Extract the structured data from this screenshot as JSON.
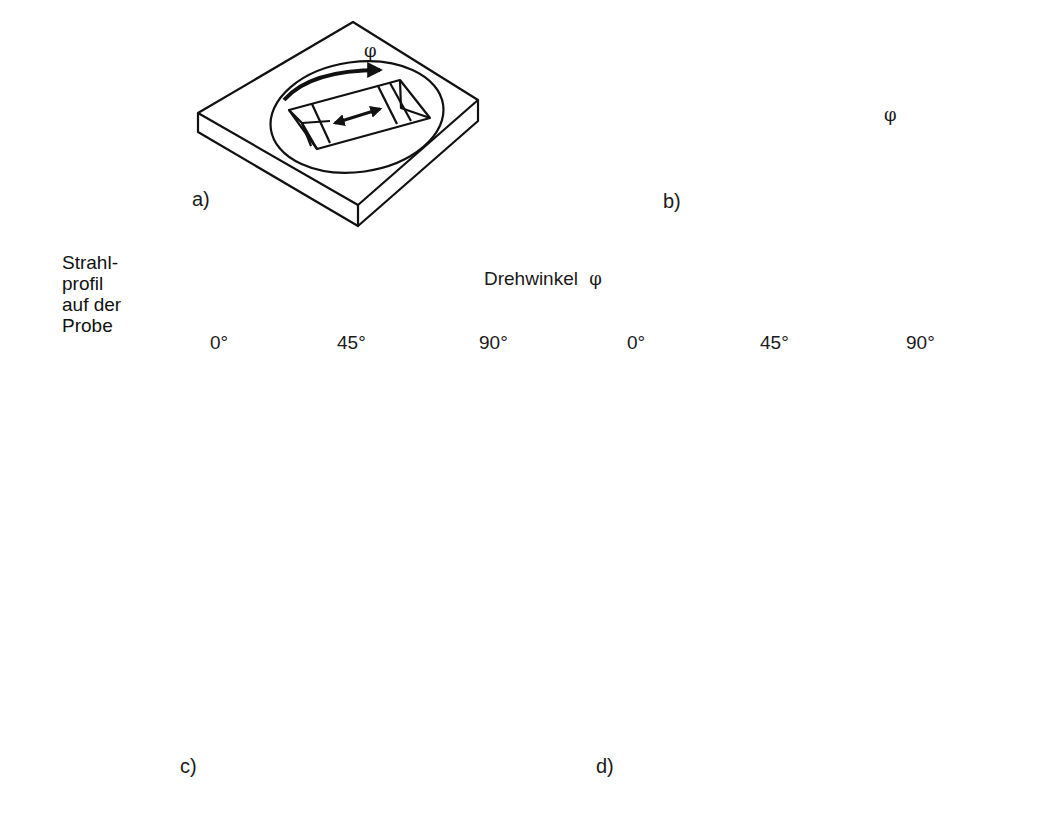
{
  "figure_a": {
    "label": "a)",
    "phi": "φ"
  },
  "figure_b": {
    "label": "b)",
    "phi": "φ"
  },
  "table": {
    "row_header": [
      "Strahl-",
      "profil",
      "auf der",
      "Probe"
    ],
    "column_group_title": "Drehwinkel",
    "column_group_symbol": "φ",
    "angles_c": [
      "0°",
      "45°",
      "90°"
    ],
    "angles_d": [
      "0°",
      "45°",
      "90°"
    ],
    "panel_c_label": "c)",
    "panel_d_label": "d)",
    "beam_profiles": [
      "dot",
      "vertical-bar",
      "horizontal-bar"
    ]
  }
}
